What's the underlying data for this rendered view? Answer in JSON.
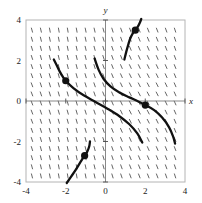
{
  "figure": {
    "title": "",
    "background_color": "#ffffff",
    "frame_color": "#b4b4b4",
    "axis_color": "#7a7a7a",
    "curve_color": "#111111",
    "slope_mark_color": "#555555",
    "point_color": "#111111"
  },
  "axes": {
    "x_title": "x",
    "y_title": "y",
    "x_ticks": [
      "-4",
      "-2",
      "0",
      "2",
      "4"
    ],
    "y_ticks": [
      "4",
      "2",
      "0",
      "-2",
      "-4"
    ]
  },
  "chart_data": {
    "type": "line",
    "title": "",
    "xlabel": "x",
    "ylabel": "y",
    "xlim": [
      -4,
      4
    ],
    "ylim": [
      -4,
      4
    ],
    "grid": false,
    "legend": "none",
    "xticks": [
      -4,
      -2,
      0,
      2,
      4
    ],
    "yticks": [
      -4,
      -2,
      0,
      2,
      4
    ],
    "xticklabels": [
      "-4",
      "-2",
      "0",
      "2",
      "4"
    ],
    "yticklabels": [
      "-4",
      "-2",
      "0",
      "2",
      "4"
    ],
    "slope_field": {
      "marker": "short steep dash",
      "x_start": -3.7,
      "x_step": 0.45,
      "y_start": -3.7,
      "y_step": 0.45,
      "mark_length": 5,
      "typical_slope_degrees": -72
    },
    "series": [
      {
        "name": "solution-curve-1",
        "marked_point": [
          1.5,
          3.5
        ],
        "points": [
          [
            0.95,
            2.05
          ],
          [
            1.05,
            2.45
          ],
          [
            1.15,
            2.8
          ],
          [
            1.25,
            3.1
          ],
          [
            1.38,
            3.35
          ],
          [
            1.5,
            3.5
          ],
          [
            1.62,
            3.66
          ],
          [
            1.72,
            3.85
          ],
          [
            1.8,
            4.05
          ]
        ]
      },
      {
        "name": "solution-curve-2",
        "marked_point": [
          -2.0,
          1.0
        ],
        "points": [
          [
            -2.6,
            2.05
          ],
          [
            -2.45,
            1.75
          ],
          [
            -2.3,
            1.45
          ],
          [
            -2.15,
            1.2
          ],
          [
            -2.0,
            1.0
          ],
          [
            -1.6,
            0.62
          ],
          [
            -1.1,
            0.28
          ],
          [
            -0.5,
            -0.05
          ],
          [
            0.1,
            -0.38
          ],
          [
            0.7,
            -0.75
          ],
          [
            1.2,
            -1.15
          ],
          [
            1.6,
            -1.6
          ],
          [
            1.85,
            -2.05
          ]
        ]
      },
      {
        "name": "solution-curve-3",
        "marked_point": [
          2.0,
          -0.2
        ],
        "points": [
          [
            -0.55,
            2.1
          ],
          [
            -0.35,
            1.55
          ],
          [
            -0.1,
            1.1
          ],
          [
            0.25,
            0.72
          ],
          [
            0.7,
            0.42
          ],
          [
            1.2,
            0.18
          ],
          [
            1.65,
            -0.02
          ],
          [
            2.0,
            -0.2
          ],
          [
            2.45,
            -0.45
          ],
          [
            2.85,
            -0.82
          ],
          [
            3.2,
            -1.3
          ],
          [
            3.4,
            -1.75
          ],
          [
            3.5,
            -2.1
          ]
        ]
      },
      {
        "name": "solution-curve-4",
        "marked_point": [
          -1.05,
          -2.7
        ],
        "points": [
          [
            -1.95,
            -4.05
          ],
          [
            -1.72,
            -3.72
          ],
          [
            -1.5,
            -3.4
          ],
          [
            -1.3,
            -3.08
          ],
          [
            -1.15,
            -2.85
          ],
          [
            -1.05,
            -2.7
          ],
          [
            -0.92,
            -2.5
          ],
          [
            -0.82,
            -2.25
          ],
          [
            -0.78,
            -2.0
          ]
        ]
      }
    ],
    "marked_points": [
      {
        "label": "",
        "x": 1.5,
        "y": 3.5
      },
      {
        "label": "",
        "x": -2.0,
        "y": 1.0
      },
      {
        "label": "",
        "x": 2.0,
        "y": -0.2
      },
      {
        "label": "",
        "x": -1.05,
        "y": -2.7
      }
    ]
  }
}
